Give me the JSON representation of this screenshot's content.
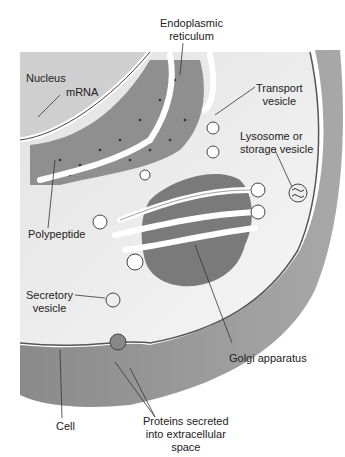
{
  "diagram": {
    "labels": {
      "er": [
        "Endoplasmic",
        "reticulum"
      ],
      "nucleus": "Nucleus",
      "mrna": "mRNA",
      "transport": [
        "Transport",
        "vesicle"
      ],
      "lysosome": [
        "Lysosome or",
        "storage vesicle"
      ],
      "polypeptide": "Polypeptide",
      "secretory": [
        "Secretory",
        "vesicle"
      ],
      "golgi": "Golgi apparatus",
      "cell": "Cell",
      "proteins": [
        "Proteins secreted",
        "into extracellular",
        "space"
      ]
    }
  }
}
